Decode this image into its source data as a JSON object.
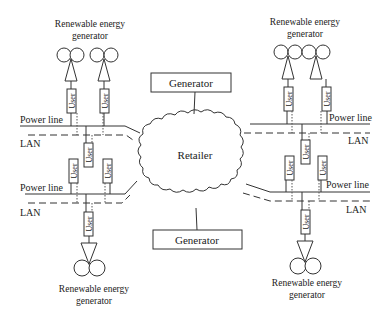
{
  "diagram": {
    "center": {
      "label": "Retailer"
    },
    "generators": [
      {
        "id": "top",
        "label": "Generator"
      },
      {
        "id": "bottom",
        "label": "Generator"
      }
    ],
    "renewable_label_line1": "Renewable energy",
    "renewable_label_line2": "generator",
    "labels": {
      "power_line": "Power line",
      "lan": "LAN",
      "user": "User"
    },
    "clusters": [
      {
        "position": "top-left",
        "renewable_generators": 2,
        "users": 3
      },
      {
        "position": "bottom-left",
        "renewable_generators": 1,
        "users": 3
      },
      {
        "position": "top-right",
        "renewable_generators": 2,
        "users": 3
      },
      {
        "position": "bottom-right",
        "renewable_generators": 1,
        "users": 3
      }
    ]
  }
}
